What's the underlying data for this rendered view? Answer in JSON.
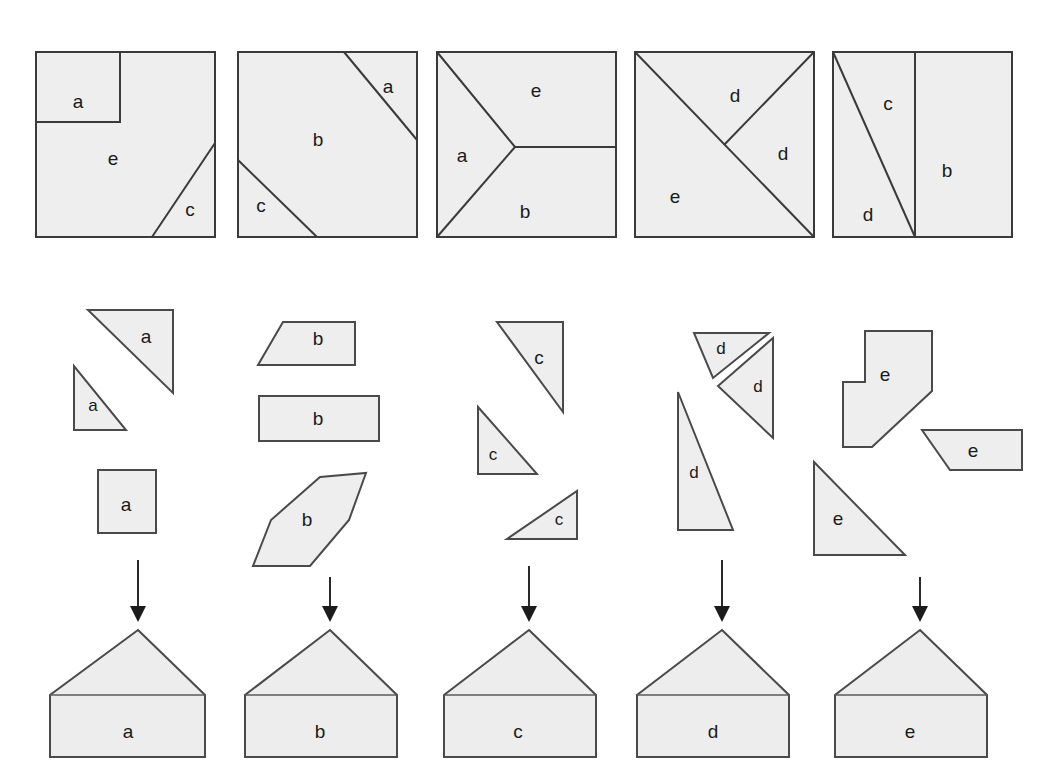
{
  "figure": {
    "background_color": "#ffffff",
    "shape_fill": "#eeeeee",
    "shape_stroke": "#3a3a3a",
    "arrow_color": "#1c1c1c"
  },
  "top_row": {
    "description": "Five squares, each partitioned into labeled regions",
    "squares": [
      {
        "id": "square-1",
        "regions": [
          {
            "label": "a",
            "x": 78,
            "y": 103
          },
          {
            "label": "e",
            "x": 113,
            "y": 160
          },
          {
            "label": "c",
            "x": 190,
            "y": 211
          }
        ]
      },
      {
        "id": "square-2",
        "regions": [
          {
            "label": "a",
            "x": 388,
            "y": 88
          },
          {
            "label": "b",
            "x": 318,
            "y": 141
          },
          {
            "label": "c",
            "x": 261,
            "y": 207
          }
        ]
      },
      {
        "id": "square-3",
        "regions": [
          {
            "label": "e",
            "x": 536,
            "y": 92
          },
          {
            "label": "a",
            "x": 462,
            "y": 157
          },
          {
            "label": "b",
            "x": 525,
            "y": 213
          }
        ]
      },
      {
        "id": "square-4",
        "regions": [
          {
            "label": "d",
            "x": 735,
            "y": 97
          },
          {
            "label": "d",
            "x": 783,
            "y": 155
          },
          {
            "label": "e",
            "x": 675,
            "y": 198
          }
        ]
      },
      {
        "id": "square-5",
        "regions": [
          {
            "label": "c",
            "x": 888,
            "y": 105
          },
          {
            "label": "b",
            "x": 947,
            "y": 172
          },
          {
            "label": "d",
            "x": 868,
            "y": 216
          }
        ]
      }
    ]
  },
  "pieces_row": {
    "description": "Loose cut-out pieces for each target shape",
    "groups": [
      {
        "id": "pieces-a",
        "letter": "a",
        "pieces": [
          {
            "name": "large-right-triangle",
            "label": "a",
            "x": 146,
            "y": 336
          },
          {
            "name": "small-right-triangle",
            "label": "a",
            "x": 94,
            "y": 404
          },
          {
            "name": "square",
            "label": "a",
            "x": 126,
            "y": 504
          }
        ]
      },
      {
        "id": "pieces-b",
        "letter": "b",
        "pieces": [
          {
            "name": "trapezoid",
            "label": "b",
            "x": 317,
            "y": 338
          },
          {
            "name": "rectangle",
            "label": "b",
            "x": 317,
            "y": 419
          },
          {
            "name": "hexagon",
            "label": "b",
            "x": 307,
            "y": 519
          }
        ]
      },
      {
        "id": "pieces-c",
        "letter": "c",
        "pieces": [
          {
            "name": "triangle-upper",
            "label": "c",
            "x": 538,
            "y": 357
          },
          {
            "name": "triangle-middle",
            "label": "c",
            "x": 491,
            "y": 455
          },
          {
            "name": "triangle-lower",
            "label": "c",
            "x": 559,
            "y": 519
          }
        ]
      },
      {
        "id": "pieces-d",
        "letter": "d",
        "pieces": [
          {
            "name": "small-triangle-left",
            "label": "d",
            "x": 718,
            "y": 349
          },
          {
            "name": "small-triangle-right",
            "label": "d",
            "x": 757,
            "y": 383
          },
          {
            "name": "tall-triangle",
            "label": "d",
            "x": 692,
            "y": 471
          }
        ]
      },
      {
        "id": "pieces-e",
        "letter": "e",
        "pieces": [
          {
            "name": "notched-polygon",
            "label": "e",
            "x": 862,
            "y": 375
          },
          {
            "name": "quadrilateral",
            "label": "e",
            "x": 964,
            "y": 430
          },
          {
            "name": "right-triangle",
            "label": "e",
            "x": 838,
            "y": 518
          }
        ]
      }
    ]
  },
  "arrows": {
    "description": "Downward arrows linking pieces to assembled house",
    "items": [
      {
        "id": "arrow-a",
        "x": 138
      },
      {
        "id": "arrow-b",
        "x": 330
      },
      {
        "id": "arrow-c",
        "x": 529
      },
      {
        "id": "arrow-d",
        "x": 722
      },
      {
        "id": "arrow-e",
        "x": 920
      }
    ]
  },
  "bottom_row": {
    "description": "Five identical assembled house (pentagon) targets",
    "houses": [
      {
        "id": "house-a",
        "label": "a",
        "label_x": 128,
        "label_y": 733
      },
      {
        "id": "house-b",
        "label": "b",
        "label_x": 320,
        "label_y": 733
      },
      {
        "id": "house-c",
        "label": "c",
        "label_x": 518,
        "label_y": 733
      },
      {
        "id": "house-d",
        "label": "d",
        "label_x": 713,
        "label_y": 733
      },
      {
        "id": "house-e",
        "label": "e",
        "label_x": 910,
        "label_y": 733
      }
    ]
  }
}
